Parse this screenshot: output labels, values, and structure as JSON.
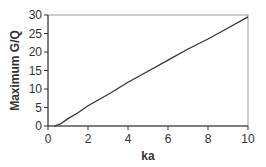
{
  "chart_data": {
    "type": "line",
    "title": "",
    "xlabel": "ka",
    "ylabel": "Maximum G/Q",
    "xlim": [
      0,
      10
    ],
    "ylim": [
      0,
      30
    ],
    "xticks": [
      0,
      2,
      4,
      6,
      8,
      10
    ],
    "yticks": [
      0,
      5,
      10,
      15,
      20,
      25,
      30
    ],
    "grid": false,
    "legend": null,
    "series": [
      {
        "name": "Maximum G/Q",
        "color": "#333333",
        "x": [
          0.3,
          0.6,
          1.0,
          1.5,
          2.0,
          3.0,
          4.0,
          5.0,
          6.0,
          7.0,
          8.0,
          9.0,
          10.0
        ],
        "values": [
          0.0,
          0.5,
          2.0,
          3.6,
          5.5,
          8.5,
          11.8,
          14.8,
          17.8,
          20.8,
          23.5,
          26.5,
          29.5
        ]
      }
    ]
  },
  "layout": {
    "plot_left": 48,
    "plot_top": 15,
    "plot_right": 248,
    "plot_bottom": 126,
    "frame_color": "#999999",
    "axis_color": "#333333"
  }
}
